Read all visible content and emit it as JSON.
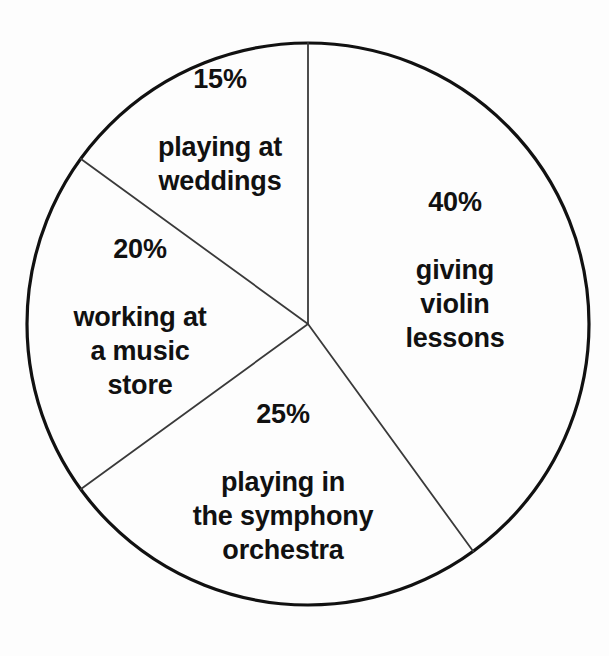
{
  "chart_data": {
    "type": "pie",
    "title": "",
    "subtitle": "",
    "xlabel": "",
    "ylabel": "",
    "legend_position": "none",
    "grid": false,
    "start_angle_deg": 0,
    "direction": "clockwise",
    "units": "percent",
    "total": 100,
    "categories": [
      "giving violin lessons",
      "playing in the symphony orchestra",
      "working at a music store",
      "playing at weddings"
    ],
    "values": [
      40,
      25,
      20,
      15
    ],
    "slices": [
      {
        "percent_label": "40%",
        "value": 40,
        "description": "giving\nviolin\nlessons",
        "description_plain": "giving violin lessons",
        "start_deg": 0,
        "end_deg": 144,
        "label_x": 455,
        "label_y": 270,
        "fill": "#ffffff",
        "stroke": "#1a1a1a"
      },
      {
        "percent_label": "25%",
        "value": 25,
        "description": "playing in\nthe symphony\norchestra",
        "description_plain": "playing in the symphony orchestra",
        "start_deg": 144,
        "end_deg": 234,
        "label_x": 283,
        "label_y": 482,
        "fill": "#ffffff",
        "stroke": "#1a1a1a"
      },
      {
        "percent_label": "20%",
        "value": 20,
        "description": "working at\na music\nstore",
        "description_plain": "working at a music store",
        "start_deg": 234,
        "end_deg": 306,
        "label_x": 140,
        "label_y": 317,
        "fill": "#ffffff",
        "stroke": "#1a1a1a"
      },
      {
        "percent_label": "15%",
        "value": 15,
        "description": "playing at\nweddings",
        "description_plain": "playing at weddings",
        "start_deg": 306,
        "end_deg": 360,
        "label_x": 220,
        "label_y": 130,
        "fill": "#ffffff",
        "stroke": "#1a1a1a"
      }
    ],
    "geometry": {
      "center_x": 308,
      "center_y": 324,
      "radius": 281,
      "outline_stroke_width": 3.2,
      "divider_stroke_width": 1.8
    },
    "colors": {
      "background": "#fdfdfd",
      "outline": "#111111",
      "divider": "#3a3a3a",
      "text": "#111111"
    }
  }
}
